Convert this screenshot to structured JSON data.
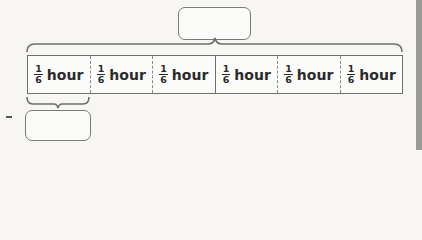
{
  "diagram": {
    "type": "tape-diagram",
    "top_answer_box": {
      "value": ""
    },
    "bottom_answer_box": {
      "value": ""
    },
    "segments": [
      {
        "numerator": "1",
        "denominator": "6",
        "unit": "hour"
      },
      {
        "numerator": "1",
        "denominator": "6",
        "unit": "hour"
      },
      {
        "numerator": "1",
        "denominator": "6",
        "unit": "hour"
      },
      {
        "numerator": "1",
        "denominator": "6",
        "unit": "hour"
      },
      {
        "numerator": "1",
        "denominator": "6",
        "unit": "hour"
      },
      {
        "numerator": "1",
        "denominator": "6",
        "unit": "hour"
      }
    ],
    "divider_styles": [
      "dashed",
      "dashed",
      "solid",
      "dashed",
      "dashed"
    ],
    "colors": {
      "line": "#6e6e6e",
      "text": "#2a2a2a",
      "background": "#f7f6f3"
    }
  }
}
